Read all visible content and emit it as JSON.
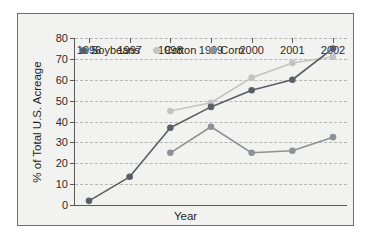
{
  "chart_data": {
    "type": "line",
    "title": "",
    "xlabel": "Year",
    "ylabel": "% of Total U.S. Acreage",
    "categories": [
      1996,
      1997,
      1998,
      1999,
      2000,
      2001,
      2002
    ],
    "x_tick_labels": [
      "1996",
      "1997",
      "1998",
      "1999",
      "2000",
      "2001",
      "2002"
    ],
    "y_tick_labels": [
      "0",
      "10",
      "20",
      "30",
      "40",
      "50",
      "60",
      "70",
      "80"
    ],
    "y_ticks": [
      0,
      10,
      20,
      30,
      40,
      50,
      60,
      70,
      80
    ],
    "ylim": [
      0,
      80
    ],
    "grid": "horizontal-dashed",
    "legend_position": "top-left-inside",
    "series": [
      {
        "name": "Soybeans",
        "color": "#5a5f66",
        "x": [
          1996,
          1997,
          1998,
          1999,
          2000,
          2001,
          2002
        ],
        "values": [
          2,
          13.5,
          37,
          47,
          55,
          60,
          75
        ]
      },
      {
        "name": "Cotton",
        "color": "#c3c3c0",
        "x": [
          1998,
          1999,
          2000,
          2001,
          2002
        ],
        "values": [
          45,
          49,
          61,
          68,
          71
        ]
      },
      {
        "name": "Corn",
        "color": "#8e9196",
        "x": [
          1998,
          1999,
          2000,
          2001,
          2002
        ],
        "values": [
          25,
          37.5,
          25,
          26,
          32.5
        ]
      }
    ]
  },
  "colors": {
    "panel_background": "#f2f2f0",
    "panel_border": "#6d6d6d",
    "axis": "#5a5a5a",
    "gridline": "#b9b6b0",
    "text": "#1f1f1f"
  }
}
